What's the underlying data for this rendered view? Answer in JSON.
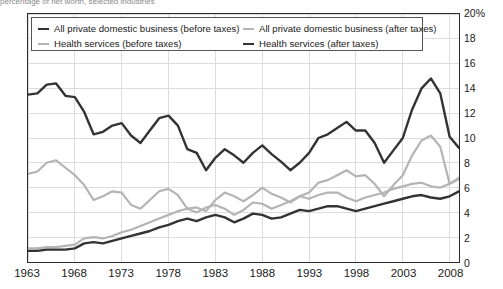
{
  "top_clipped_text": "percentage of net worth, selected industries",
  "legend": {
    "entries": [
      {
        "label": "All private domestic business (before taxes)",
        "color": "#333333",
        "style": "dark"
      },
      {
        "label": "All private domestic business (after taxes)",
        "color": "#b4b4b4",
        "style": "gray"
      },
      {
        "label": "Health services (before taxes)",
        "color": "#b4b4b4",
        "style": "gray"
      },
      {
        "label": "Health services (after taxes)",
        "color": "#333333",
        "style": "dark"
      }
    ]
  },
  "y_axis": {
    "ticks": [
      "20%",
      "18",
      "16",
      "14",
      "12",
      "10",
      "8",
      "6",
      "4",
      "2",
      "0"
    ],
    "min": 0,
    "max": 20,
    "step": 2,
    "position": "right"
  },
  "x_axis": {
    "ticks": [
      "1963",
      "1968",
      "1973",
      "1978",
      "1983",
      "1988",
      "1993",
      "1998",
      "2003",
      "2008"
    ],
    "min": 1963,
    "max": 2009,
    "step": 5
  },
  "chart_data": {
    "type": "line",
    "title": "",
    "subtitle": "",
    "xlabel": "",
    "ylabel": "",
    "xlim": [
      1963,
      2009
    ],
    "ylim": [
      0,
      20
    ],
    "grid": true,
    "legend_position": "top-inside",
    "x": [
      1963,
      1964,
      1965,
      1966,
      1967,
      1968,
      1969,
      1970,
      1971,
      1972,
      1973,
      1974,
      1975,
      1976,
      1977,
      1978,
      1979,
      1980,
      1981,
      1982,
      1983,
      1984,
      1985,
      1986,
      1987,
      1988,
      1989,
      1990,
      1991,
      1992,
      1993,
      1994,
      1995,
      1996,
      1997,
      1998,
      1999,
      2000,
      2001,
      2002,
      2003,
      2004,
      2005,
      2006,
      2007,
      2008,
      2009
    ],
    "series": [
      {
        "name": "All private domestic business (before taxes)",
        "color": "#333333",
        "width": 2.4,
        "values": [
          13.5,
          13.6,
          14.3,
          14.4,
          13.4,
          13.3,
          12.1,
          10.3,
          10.5,
          11.0,
          11.2,
          10.2,
          9.6,
          10.6,
          11.6,
          11.8,
          11.0,
          9.1,
          8.8,
          7.4,
          8.4,
          9.1,
          8.6,
          8.0,
          8.8,
          9.4,
          8.7,
          8.1,
          7.4,
          8.0,
          8.8,
          10.0,
          10.3,
          10.8,
          11.3,
          10.6,
          10.6,
          9.6,
          8.0,
          9.0,
          10.0,
          12.3,
          14.0,
          14.8,
          13.6,
          10.1,
          9.2
        ]
      },
      {
        "name": "All private domestic business (after taxes)",
        "color": "#b4b4b4",
        "width": 2.2,
        "values": [
          7.1,
          7.3,
          8.0,
          8.2,
          7.6,
          7.0,
          6.2,
          5.0,
          5.3,
          5.7,
          5.6,
          4.6,
          4.3,
          5.0,
          5.7,
          5.9,
          5.4,
          4.3,
          4.4,
          4.1,
          5.0,
          5.6,
          5.3,
          4.9,
          5.4,
          6.0,
          5.5,
          5.2,
          4.8,
          5.3,
          5.6,
          6.4,
          6.6,
          7.0,
          7.4,
          6.9,
          7.0,
          6.3,
          5.3,
          6.2,
          7.0,
          8.6,
          9.8,
          10.2,
          9.3,
          6.3,
          6.8
        ]
      },
      {
        "name": "Health services (before taxes)",
        "color": "#b4b4b4",
        "width": 2.2,
        "values": [
          1.1,
          1.1,
          1.2,
          1.2,
          1.3,
          1.4,
          1.9,
          2.0,
          1.9,
          2.1,
          2.4,
          2.6,
          2.9,
          3.2,
          3.5,
          3.8,
          4.1,
          4.3,
          4.0,
          4.4,
          4.6,
          4.3,
          3.8,
          4.2,
          4.8,
          4.7,
          4.3,
          4.6,
          4.9,
          5.3,
          5.1,
          5.4,
          5.6,
          5.6,
          5.2,
          4.9,
          5.2,
          5.4,
          5.6,
          5.9,
          6.1,
          6.3,
          6.4,
          6.1,
          6.0,
          6.3,
          6.7
        ]
      },
      {
        "name": "Health services (after taxes)",
        "color": "#333333",
        "width": 2.4,
        "values": [
          0.9,
          0.9,
          1.0,
          1.0,
          1.0,
          1.1,
          1.5,
          1.6,
          1.5,
          1.7,
          1.9,
          2.1,
          2.3,
          2.5,
          2.8,
          3.0,
          3.3,
          3.5,
          3.3,
          3.6,
          3.8,
          3.6,
          3.2,
          3.5,
          3.9,
          3.8,
          3.5,
          3.6,
          3.9,
          4.2,
          4.1,
          4.3,
          4.5,
          4.5,
          4.3,
          4.1,
          4.3,
          4.5,
          4.7,
          4.9,
          5.1,
          5.3,
          5.4,
          5.2,
          5.1,
          5.3,
          5.7
        ]
      }
    ]
  }
}
